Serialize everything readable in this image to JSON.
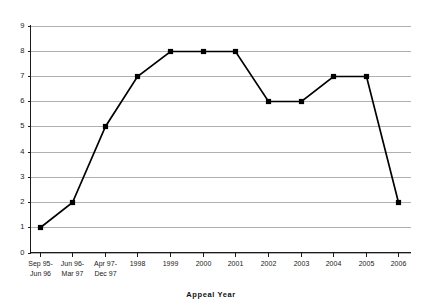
{
  "chart_data": {
    "type": "line",
    "title": "",
    "xlabel": "Appeal  Year",
    "ylabel": "",
    "ylim": [
      0,
      9
    ],
    "ytick_step": 1,
    "grid": true,
    "legend": "none",
    "marker": "filled-square",
    "categories": [
      "Sep 95–\nJun 96",
      "Jun 96–\nMar 97",
      "Apr 97–\nDec 97",
      "1998",
      "1999",
      "2000",
      "2001",
      "2002",
      "2003",
      "2004",
      "2005",
      "2006"
    ],
    "category_lines": [
      [
        "Sep 95-",
        "Jun 96"
      ],
      [
        "Jun 96-",
        "Mar 97"
      ],
      [
        "Apr 97-",
        "Dec 97"
      ],
      [
        "1998"
      ],
      [
        "1999"
      ],
      [
        "2000"
      ],
      [
        "2001"
      ],
      [
        "2002"
      ],
      [
        "2003"
      ],
      [
        "2004"
      ],
      [
        "2005"
      ],
      [
        "2006"
      ]
    ],
    "values": [
      1,
      2,
      5,
      7,
      8,
      8,
      8,
      6,
      6,
      7,
      7,
      2
    ],
    "ytick_labels": [
      "0",
      "1",
      "2",
      "3",
      "4",
      "5",
      "6",
      "7",
      "8",
      "9"
    ],
    "colors": {
      "series": "#000000",
      "grid": "#b0b0b0",
      "axis": "#1a1a1a",
      "background": "#ffffff"
    }
  }
}
